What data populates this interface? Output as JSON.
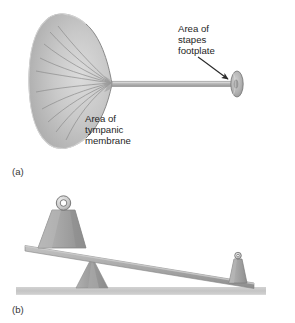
{
  "figure": {
    "background_color": "#ffffff",
    "panels": [
      {
        "id": "a",
        "label": "(a)",
        "caption_role": "middle-ear-area-ratio-diagram",
        "annotations": [
          {
            "name": "tympanic-membrane-label",
            "lines": [
              "Area of",
              "tympanic",
              "membrane"
            ]
          },
          {
            "name": "stapes-footplate-label",
            "lines": [
              "Area of",
              "stapes",
              "footplate"
            ]
          }
        ],
        "shapes": [
          {
            "name": "tympanic-membrane-cone",
            "fill": "#c6c6c6",
            "stroke": "#7d7d7d"
          },
          {
            "name": "connecting-rod",
            "fill": "#bdbdbd",
            "stroke": "#8a8a8a"
          },
          {
            "name": "stapes-footplate-disc",
            "fill": "#b4b4b4",
            "stroke": "#7a7a7a"
          },
          {
            "name": "pointer-arrow",
            "stroke": "#2b2b2b"
          }
        ]
      },
      {
        "id": "b",
        "label": "(b)",
        "caption_role": "lever-analogy-diagram",
        "shapes": [
          {
            "name": "ground-surface",
            "fill": "#c9c9c9"
          },
          {
            "name": "fulcrum-triangle",
            "fill": "#9d9d9d",
            "stroke": "#8a8a8a"
          },
          {
            "name": "lever-beam",
            "fill": "#a8a8a8",
            "stroke": "#848484"
          },
          {
            "name": "large-weight",
            "fill": "#a5a5a5",
            "stroke": "#7b7b7b"
          },
          {
            "name": "large-weight-ring",
            "fill": "#d6d6d6",
            "stroke": "#6f6f6f"
          },
          {
            "name": "small-weight",
            "fill": "#a5a5a5",
            "stroke": "#7b7b7b"
          },
          {
            "name": "small-weight-ring",
            "fill": "#d6d6d6",
            "stroke": "#6f6f6f"
          }
        ]
      }
    ],
    "colors": {
      "membrane_light": "#d3d3d3",
      "membrane_mid": "#c0c0c0",
      "membrane_dark": "#9e9e9e",
      "rib_line": "#8b8b8b",
      "metal_light": "#cfcfcf",
      "metal_mid": "#a6a6a6",
      "metal_dark": "#7f7f7f",
      "ground": "#c9c9c9",
      "text": "#252525",
      "arrow": "#2b2b2b"
    }
  }
}
